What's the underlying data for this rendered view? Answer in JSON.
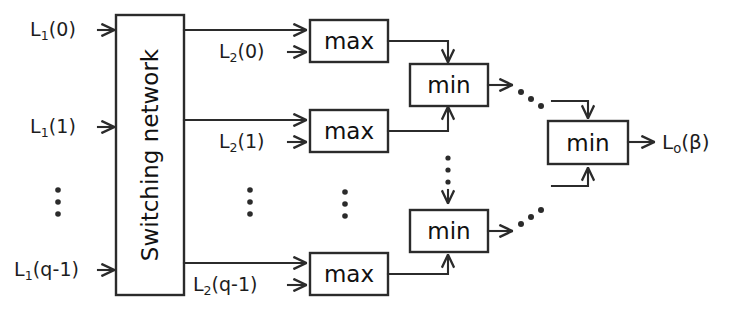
{
  "diagram": {
    "colors": {
      "stroke": "#2b2b2b",
      "text": "#1d1d1d",
      "background": "#ffffff"
    },
    "switching_network": {
      "label": "Switching network"
    },
    "inputs": [
      {
        "id": "in-0",
        "base": "L",
        "subscript": "1",
        "arg": "(0)",
        "text": "L₁(0)"
      },
      {
        "id": "in-1",
        "base": "L",
        "subscript": "1",
        "arg": "(1)",
        "text": "L₁(1)"
      },
      {
        "id": "in-q1",
        "base": "L",
        "subscript": "1",
        "arg": "(q-1)",
        "text": "L₁(q-1)"
      }
    ],
    "mid_signals": [
      {
        "id": "mid-0",
        "base": "L",
        "subscript": "2",
        "arg": "(0)",
        "text": "L₂(0)"
      },
      {
        "id": "mid-1",
        "base": "L",
        "subscript": "2",
        "arg": "(1)",
        "text": "L₂(1)"
      },
      {
        "id": "mid-q1",
        "base": "L",
        "subscript": "2",
        "arg": "(q-1)",
        "text": "L₂(q-1)"
      }
    ],
    "max_blocks": [
      {
        "id": "max-0",
        "label": "max"
      },
      {
        "id": "max-1",
        "label": "max"
      },
      {
        "id": "max-q1",
        "label": "max"
      }
    ],
    "min_blocks": [
      {
        "id": "min-top",
        "label": "min"
      },
      {
        "id": "min-bottom",
        "label": "min"
      },
      {
        "id": "min-final",
        "label": "min"
      }
    ],
    "output": {
      "id": "out-0",
      "base": "L",
      "subscript": "o",
      "arg": "(β)",
      "text": "Lₒ(β)"
    },
    "ellipses": [
      {
        "id": "ellipsis-inputs",
        "orientation": "vertical"
      },
      {
        "id": "ellipsis-mid",
        "orientation": "vertical"
      },
      {
        "id": "ellipsis-max",
        "orientation": "vertical"
      },
      {
        "id": "ellipsis-min",
        "orientation": "vertical"
      },
      {
        "id": "ellipsis-top-diag",
        "orientation": "diagonal-down"
      },
      {
        "id": "ellipsis-bottom-diag",
        "orientation": "diagonal-up"
      }
    ]
  }
}
